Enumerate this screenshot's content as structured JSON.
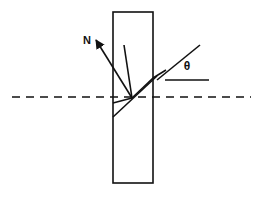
{
  "figure": {
    "kind": "optics-ray-diagram",
    "background_color": "#ffffff",
    "stroke_color": "#111111",
    "labels": {
      "normal": "N",
      "angle": "θ"
    },
    "slab": {
      "name": "glass-slab",
      "x": 113,
      "y": 12,
      "width": 40,
      "height": 171,
      "stroke_width": 1.6,
      "fill": "none"
    },
    "dashed_axis": {
      "name": "horizontal-dashed-axis",
      "x1": 12,
      "y1": 97,
      "x2": 251,
      "y2": 97,
      "stroke_width": 1.6,
      "dash": "8 6"
    },
    "rays": [
      {
        "name": "normal-arrow",
        "x1": 96,
        "y1": 40,
        "x2": 132,
        "y2": 98,
        "stroke_width": 1.6,
        "arrow": "start"
      },
      {
        "name": "incident-ray",
        "x1": 124,
        "y1": 45,
        "x2": 132,
        "y2": 98,
        "stroke_width": 1.6,
        "arrow": "none"
      },
      {
        "name": "refracted-ray-inside-slab",
        "x1": 132,
        "y1": 98,
        "x2": 153,
        "y2": 78,
        "stroke_width": 1.6,
        "arrow": "none"
      },
      {
        "name": "emergent-ray-upper",
        "x1": 153,
        "y1": 78,
        "x2": 166,
        "y2": 70,
        "stroke_width": 1.6,
        "arrow": "none"
      },
      {
        "name": "lower-ray-upper-branch",
        "x1": 132,
        "y1": 98,
        "x2": 113,
        "y2": 103,
        "stroke_width": 1.6,
        "arrow": "none"
      },
      {
        "name": "lower-ray-parallel",
        "x1": 113,
        "y1": 117,
        "x2": 157,
        "y2": 76,
        "stroke_width": 1.6,
        "arrow": "none"
      },
      {
        "name": "angle-ray-theta",
        "x1": 157,
        "y1": 80,
        "x2": 200,
        "y2": 45,
        "stroke_width": 1.6,
        "arrow": "none"
      },
      {
        "name": "angle-baseline",
        "x1": 165,
        "y1": 80,
        "x2": 209,
        "y2": 80,
        "stroke_width": 1.6,
        "arrow": "none"
      }
    ],
    "label_positions": {
      "normal": {
        "x": 87,
        "y": 44
      },
      "angle": {
        "x": 187,
        "y": 70
      }
    }
  }
}
